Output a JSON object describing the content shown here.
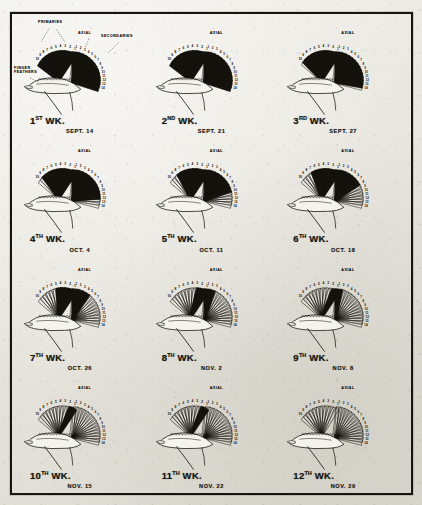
{
  "plate": {
    "title": "Wing feather development series",
    "border_color": "#17150f",
    "paper_color": "#e9e7e0",
    "ink_color": "#14120c"
  },
  "annotations": {
    "primaries": "PRIMARIES",
    "axial": "AXIAL",
    "secondaries": "SECONDARIES",
    "finger_feathers_line1": "FINGER",
    "finger_feathers_line2": "FEATHERS"
  },
  "feather_numbers": {
    "primaries": [
      "1",
      "2",
      "3",
      "4",
      "5",
      "6",
      "7",
      "8",
      "9",
      "10"
    ],
    "secondaries": [
      "1",
      "2",
      "3",
      "4",
      "5",
      "6",
      "7",
      "8",
      "9",
      "10",
      "11",
      "12",
      "13",
      "14"
    ]
  },
  "panels": [
    {
      "id": "wk1",
      "week_number": "1",
      "week_suffix": "ST",
      "week_word": "WK.",
      "date": "SEPT. 14",
      "primaries_dark": 10,
      "secondaries_dark": 14,
      "row": 1,
      "col": 1
    },
    {
      "id": "wk2",
      "week_number": "2",
      "week_suffix": "ND",
      "week_word": "WK.",
      "date": "SEPT. 21",
      "primaries_dark": 10,
      "secondaries_dark": 14,
      "row": 1,
      "col": 2
    },
    {
      "id": "wk3",
      "week_number": "3",
      "week_suffix": "RD",
      "week_word": "WK.",
      "date": "SEPT. 27",
      "primaries_dark": 9,
      "secondaries_dark": 13,
      "row": 1,
      "col": 3
    },
    {
      "id": "wk4",
      "week_number": "4",
      "week_suffix": "TH",
      "week_word": "WK.",
      "date": "OCT. 4",
      "primaries_dark": 8,
      "secondaries_dark": 11,
      "row": 2,
      "col": 1
    },
    {
      "id": "wk5",
      "week_number": "5",
      "week_suffix": "TH",
      "week_word": "WK.",
      "date": "OCT. 11",
      "primaries_dark": 7,
      "secondaries_dark": 9,
      "row": 2,
      "col": 2
    },
    {
      "id": "wk6",
      "week_number": "6",
      "week_suffix": "TH",
      "week_word": "WK.",
      "date": "OCT. 18",
      "primaries_dark": 6,
      "secondaries_dark": 7,
      "row": 2,
      "col": 3
    },
    {
      "id": "wk7",
      "week_number": "7",
      "week_suffix": "TH",
      "week_word": "WK.",
      "date": "OCT. 26",
      "primaries_dark": 4,
      "secondaries_dark": 4,
      "row": 3,
      "col": 1
    },
    {
      "id": "wk8",
      "week_number": "8",
      "week_suffix": "TH",
      "week_word": "WK.",
      "date": "NOV. 2",
      "primaries_dark": 2,
      "secondaries_dark": 2,
      "row": 3,
      "col": 2
    },
    {
      "id": "wk9",
      "week_number": "9",
      "week_suffix": "TH",
      "week_word": "WK.",
      "date": "NOV. 8",
      "primaries_dark": 1,
      "secondaries_dark": 1,
      "row": 3,
      "col": 3
    },
    {
      "id": "wk10",
      "week_number": "10",
      "week_suffix": "TH",
      "week_word": "WK.",
      "date": "NOV. 15",
      "primaries_dark": 1,
      "secondaries_dark": 0,
      "row": 4,
      "col": 1
    },
    {
      "id": "wk11",
      "week_number": "11",
      "week_suffix": "TH",
      "week_word": "WK.",
      "date": "NOV. 22",
      "primaries_dark": 1,
      "secondaries_dark": 0,
      "row": 4,
      "col": 2
    },
    {
      "id": "wk12",
      "week_number": "12",
      "week_suffix": "TH",
      "week_word": "WK.",
      "date": "NOV. 29",
      "primaries_dark": 0,
      "secondaries_dark": 0,
      "row": 4,
      "col": 3
    }
  ]
}
